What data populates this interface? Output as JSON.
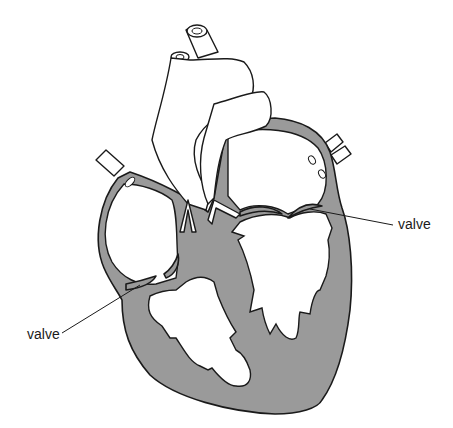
{
  "diagram": {
    "labels": [
      {
        "id": "valve-right",
        "text": "valve",
        "x": 398,
        "y": 229
      },
      {
        "id": "valve-left",
        "text": "valve",
        "x": 27,
        "y": 339
      }
    ],
    "colors": {
      "muscle_fill": "#9a9a9a",
      "outline": "#1a1a1a",
      "background": "#ffffff"
    }
  }
}
